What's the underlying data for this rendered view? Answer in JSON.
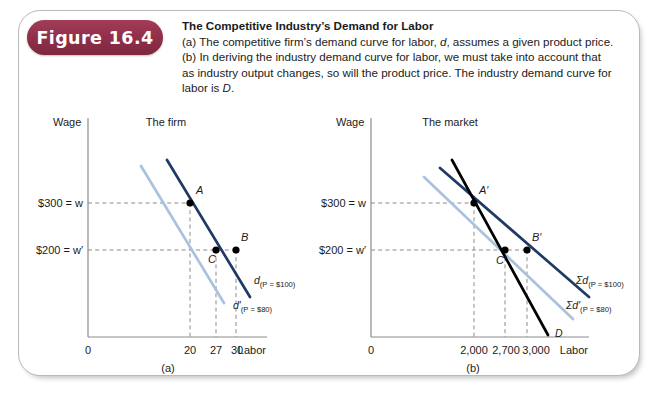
{
  "figure": {
    "badge_label": "Figure 16.4",
    "badge_color": "#93304b",
    "title": "The Competitive Industry’s Demand for Labor",
    "caption_lines": [
      "(a) The competitive firm’s demand curve for labor, d, assumes a given product price.",
      "(b) In deriving the industry demand curve for labor, we must take into account that",
      "as industry output changes, so will the product price. The industry demand curve for",
      "labor is D."
    ]
  },
  "colors": {
    "dark_blue": "#1f3a64",
    "light_blue": "#a9c2dd",
    "black": "#000000",
    "axis_gray": "#8b8b8b",
    "frame_gray": "#b9b9b9"
  },
  "chart_data": [
    {
      "type": "line",
      "panel": "(a)",
      "title": "The firm",
      "xlabel": "Labor",
      "ylabel": "Wage",
      "origin_label": "0",
      "xticks": [
        "20",
        "27",
        "30"
      ],
      "xtick_values": [
        20,
        27,
        30
      ],
      "yticks": [
        "$300 = w",
        "$200 = w′"
      ],
      "ytick_values": [
        300,
        200
      ],
      "grid": false,
      "legend": "inline-curve-labels",
      "series": [
        {
          "name": "d",
          "sub": "(P = $100)",
          "color": "#1f3a64",
          "label_main": "d",
          "label_sub": "(P = $100)",
          "points": [
            [
              17,
              360
            ],
            [
              34,
              120
            ]
          ]
        },
        {
          "name": "d′",
          "sub": "(P = $80)",
          "color": "#a9c2dd",
          "label_main": "d′",
          "label_sub": "(P = $80)",
          "points": [
            [
              14,
              360
            ],
            [
              31,
              120
            ]
          ]
        }
      ],
      "marked_points": [
        {
          "label": "A",
          "x": 20,
          "y": 300,
          "on": "d"
        },
        {
          "label": "B",
          "x": 30,
          "y": 200,
          "on": "d"
        },
        {
          "label": "C",
          "x": 27,
          "y": 200,
          "on": "d′"
        }
      ]
    },
    {
      "type": "line",
      "panel": "(b)",
      "title": "The market",
      "xlabel": "Labor",
      "ylabel": "Wage",
      "origin_label": "0",
      "xticks": [
        "2,000",
        "2,700",
        "3,000"
      ],
      "xtick_values": [
        2000,
        2700,
        3000
      ],
      "yticks": [
        "$300 = w",
        "$200 = w′"
      ],
      "ytick_values": [
        300,
        200
      ],
      "grid": false,
      "legend": "inline-curve-labels",
      "series": [
        {
          "name": "Σd",
          "sub": "(P = $100)",
          "color": "#1f3a64",
          "label_main": "Σd",
          "label_sub": "(P = $100)",
          "points": [
            [
              1700,
              380
            ],
            [
              3400,
              130
            ]
          ]
        },
        {
          "name": "Σd′",
          "sub": "(P = $80)",
          "color": "#a9c2dd",
          "label_main": "Σd′",
          "label_sub": "(P = $80)",
          "points": [
            [
              1440,
              360
            ],
            [
              3220,
              110
            ]
          ]
        },
        {
          "name": "D",
          "sub": "",
          "color": "#000000",
          "label_main": "D",
          "label_sub": "",
          "points": [
            [
              1870,
              400
            ],
            [
              2880,
              60
            ]
          ]
        }
      ],
      "marked_points": [
        {
          "label": "A′",
          "x": 2000,
          "y": 300,
          "on": "Σd"
        },
        {
          "label": "B′",
          "x": 3000,
          "y": 200,
          "on": "Σd"
        },
        {
          "label": "C′",
          "x": 2700,
          "y": 200,
          "on": "Σd′"
        }
      ]
    }
  ]
}
